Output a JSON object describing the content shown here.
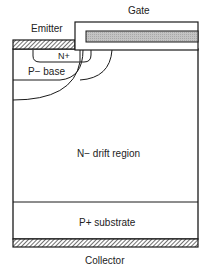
{
  "diagram": {
    "labels": {
      "gate": "Gate",
      "emitter": "Emitter",
      "n_plus": "N+",
      "p_base": "P− base",
      "drift": "N− drift region",
      "substrate": "P+ substrate",
      "collector": "Collector"
    },
    "colors": {
      "line": "#1a1a1a",
      "metal_hatch": "#555555",
      "gate_poly": "#bdbdbd"
    }
  }
}
